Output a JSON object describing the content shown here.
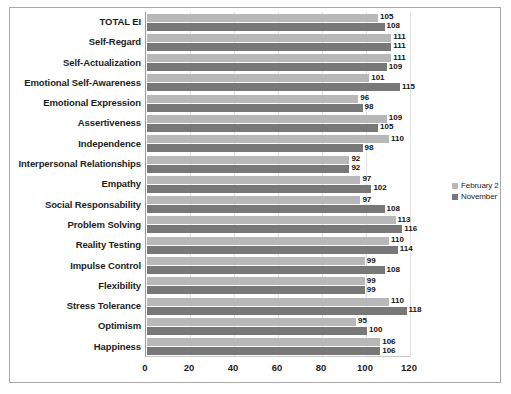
{
  "chart_data": {
    "type": "bar",
    "orientation": "horizontal",
    "title": "",
    "xlabel": "",
    "ylabel": "",
    "xlim": [
      0,
      120
    ],
    "xticks": [
      0,
      20,
      40,
      60,
      80,
      100,
      120
    ],
    "grid": true,
    "legend_position": "right",
    "categories": [
      "TOTAL EI",
      "Self-Regard",
      "Self-Actualization",
      "Emotional Self-Awareness",
      "Emotional Expression",
      "Assertiveness",
      "Independence",
      "Interpersonal Relationships",
      "Empathy",
      "Social Responsability",
      "Problem Solving",
      "Reality Testing",
      "Impulse Control",
      "Flexibility",
      "Stress Tolerance",
      "Optimism",
      "Happiness"
    ],
    "series": [
      {
        "name": "February 2",
        "color": "#b8b8b8",
        "values": [
          105,
          111,
          111,
          101,
          96,
          109,
          110,
          92,
          97,
          97,
          113,
          110,
          99,
          99,
          110,
          95,
          106
        ]
      },
      {
        "name": "November",
        "color": "#787878",
        "values": [
          108,
          111,
          109,
          115,
          98,
          105,
          98,
          92,
          102,
          108,
          116,
          114,
          108,
          99,
          118,
          100,
          106
        ]
      }
    ]
  },
  "legend": {
    "items": [
      {
        "label": "February 2"
      },
      {
        "label": "November"
      }
    ]
  }
}
